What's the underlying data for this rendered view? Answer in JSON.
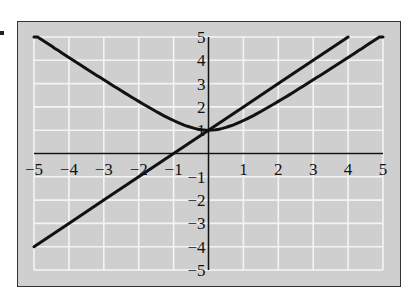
{
  "chart_data": {
    "type": "line",
    "title": "",
    "xlabel": "",
    "ylabel": "",
    "xlim": [
      -5,
      5
    ],
    "ylim": [
      -5,
      5
    ],
    "grid": true,
    "legend": null,
    "x_ticks": [
      "-5",
      "-4",
      "-3",
      "-2",
      "-1",
      "1",
      "2",
      "3",
      "4",
      "5"
    ],
    "y_ticks": [
      "5",
      "4",
      "3",
      "2",
      "1",
      "-1",
      "-2",
      "-3",
      "-4",
      "-5"
    ],
    "series": [
      {
        "name": "line",
        "equation": "y = x + 1",
        "x": [
          -5,
          -4,
          -3,
          -2,
          -1,
          0,
          1,
          2,
          3,
          4
        ],
        "y": [
          -4,
          -3,
          -2,
          -1,
          0,
          1,
          2,
          3,
          4,
          5
        ]
      },
      {
        "name": "curve",
        "equation": "y = sqrt(x^2 + 1)",
        "x": [
          -5,
          -4,
          -3,
          -2,
          -1,
          0,
          1,
          2,
          3,
          4,
          5
        ],
        "y": [
          5.1,
          4.12,
          3.16,
          2.24,
          1.41,
          1,
          1.41,
          2.24,
          3.16,
          4.12,
          5.1
        ]
      }
    ]
  },
  "colors": {
    "background": "#cfcfcf",
    "grid": "#f4f4f4",
    "line": "#111111"
  }
}
